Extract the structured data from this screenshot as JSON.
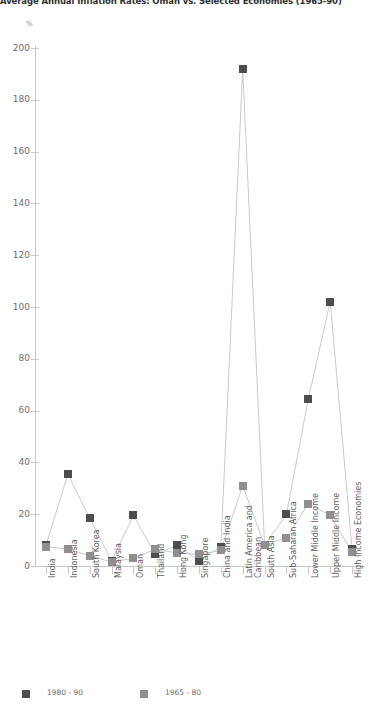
{
  "title": "Average Annual Inflation Rates: Oman vs. Selected Economies (1965-90)",
  "axis": {
    "y_unit": "%",
    "y_ticks": [
      "0",
      "20",
      "40",
      "60",
      "80",
      "100",
      "120",
      "140",
      "160",
      "180",
      "200"
    ]
  },
  "legend": {
    "items": [
      {
        "label": "1980 - 90",
        "color": "#4d4d4d"
      },
      {
        "label": "1965 - 80",
        "color": "#8f8f8f"
      }
    ]
  },
  "chart_data": {
    "type": "line",
    "title": "Average Annual Inflation Rates: Oman vs. Selected Economies (1965-90)",
    "xlabel": "",
    "ylabel": "%",
    "ylim": [
      0,
      200
    ],
    "grid": false,
    "legend_position": "bottom",
    "categories": [
      "India",
      "Indonesia",
      "South Korea",
      "Malaysia",
      "Oman",
      "Thailand",
      "Hong Kong",
      "Singapore",
      "China and India",
      "Latin America and Caribbean",
      "South Asia",
      "Sub-Saharan Africa",
      "Lower Middle Income",
      "Upper Middle Income",
      "High Income Economies"
    ],
    "series": [
      {
        "name": "1980 - 90",
        "color": "#4d4d4d",
        "values": [
          8,
          35.5,
          18.5,
          2,
          19.5,
          4.5,
          8,
          2,
          7.5,
          192,
          8,
          20,
          64.5,
          102,
          6.5
        ]
      },
      {
        "name": "1965 - 80",
        "color": "#8f8f8f",
        "values": [
          7.5,
          6.5,
          4,
          1.5,
          3,
          6.5,
          5,
          4.5,
          6,
          31,
          8,
          11,
          24,
          19.5,
          5.5
        ]
      }
    ]
  }
}
